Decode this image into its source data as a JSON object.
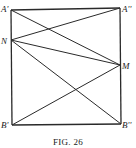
{
  "figure": {
    "caption": "FIG. 26",
    "points": {
      "A1": {
        "label": "A'",
        "x": 11,
        "y": 10
      },
      "A2": {
        "label": "A''",
        "x": 120,
        "y": 8
      },
      "N": {
        "label": "N",
        "x": 11,
        "y": 40
      },
      "M": {
        "label": "M",
        "x": 120,
        "y": 65
      },
      "B1": {
        "label": "B'",
        "x": 12,
        "y": 125
      },
      "B2": {
        "label": "B''",
        "x": 121,
        "y": 124
      }
    },
    "segments": [
      [
        "A1",
        "A2"
      ],
      [
        "A2",
        "B2"
      ],
      [
        "B2",
        "B1"
      ],
      [
        "B1",
        "A1"
      ],
      [
        "A1",
        "M"
      ],
      [
        "N",
        "A2"
      ],
      [
        "N",
        "M"
      ],
      [
        "N",
        "B2"
      ],
      [
        "B1",
        "M"
      ]
    ]
  }
}
